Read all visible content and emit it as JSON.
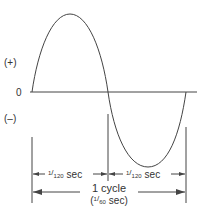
{
  "diagram": {
    "type": "sine-wave-ac-cycle",
    "colors": {
      "line": "#444444",
      "text": "#333333"
    },
    "axis_labels": {
      "positive": "(+)",
      "zero": "0",
      "negative": "(–)"
    },
    "half_cycle_1": {
      "num": "1",
      "den": "120",
      "unit": "sec"
    },
    "half_cycle_2": {
      "num": "1",
      "den": "120",
      "unit": "sec"
    },
    "full_cycle": {
      "label": "1 cycle",
      "open": "(",
      "num": "1",
      "den": "60",
      "unit": "sec)"
    }
  }
}
